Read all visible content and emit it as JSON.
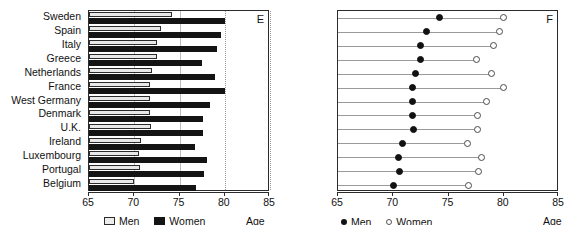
{
  "chart_data": [
    {
      "type": "bar",
      "panel": "E",
      "orientation": "horizontal",
      "title": "",
      "xlabel": "Age",
      "ylabel": "",
      "xlim": [
        65,
        85
      ],
      "xticks": [
        65,
        70,
        75,
        80,
        85
      ],
      "grid": true,
      "legend_position": "bottom",
      "categories": [
        "Sweden",
        "Spain",
        "Italy",
        "Greece",
        "Netherlands",
        "France",
        "West Germany",
        "Denmark",
        "U.K.",
        "Ireland",
        "Luxembourg",
        "Portugal",
        "Belgium"
      ],
      "series": [
        {
          "name": "Men",
          "values": [
            74.2,
            73.0,
            72.5,
            72.5,
            72.0,
            71.7,
            71.7,
            71.7,
            71.8,
            70.8,
            70.5,
            70.6,
            70.0
          ]
        },
        {
          "name": "Women",
          "values": [
            80.0,
            79.6,
            79.1,
            77.5,
            78.9,
            80.0,
            78.4,
            77.6,
            77.6,
            76.7,
            78.0,
            77.7,
            76.8
          ]
        }
      ]
    },
    {
      "type": "scatter",
      "panel": "F",
      "subtype": "dumbbell",
      "title": "",
      "xlabel": "Age",
      "ylabel": "",
      "xlim": [
        65,
        85
      ],
      "xticks": [
        65,
        70,
        75,
        80,
        85
      ],
      "grid": false,
      "legend_position": "bottom",
      "categories": [
        "Sweden",
        "Spain",
        "Italy",
        "Greece",
        "Netherlands",
        "France",
        "West Germany",
        "Denmark",
        "U.K.",
        "Ireland",
        "Luxembourg",
        "Portugal",
        "Belgium"
      ],
      "series": [
        {
          "name": "Men",
          "marker": "filled-circle",
          "values": [
            74.2,
            73.0,
            72.5,
            72.5,
            72.0,
            71.7,
            71.7,
            71.7,
            71.8,
            70.8,
            70.5,
            70.6,
            70.0
          ]
        },
        {
          "name": "Women",
          "marker": "open-circle",
          "values": [
            80.0,
            79.6,
            79.1,
            77.5,
            78.9,
            80.0,
            78.4,
            77.6,
            77.6,
            76.7,
            78.0,
            77.7,
            76.8
          ]
        }
      ]
    }
  ],
  "panel_e": {
    "letter": "E",
    "age_label": "Age",
    "tick_labels": [
      "65",
      "70",
      "75",
      "80",
      "85"
    ],
    "legend": [
      {
        "label": "Men",
        "marker": "light-square-swatch",
        "color": "#ececec"
      },
      {
        "label": "Women",
        "marker": "dark-square-swatch",
        "color": "#141414"
      }
    ],
    "category_labels": [
      "Sweden",
      "Spain",
      "Italy",
      "Greece",
      "Netherlands",
      "France",
      "West Germany",
      "Denmark",
      "U.K.",
      "Ireland",
      "Luxembourg",
      "Portugal",
      "Belgium"
    ]
  },
  "panel_f": {
    "letter": "F",
    "age_label": "Age",
    "tick_labels": [
      "65",
      "70",
      "75",
      "80",
      "85"
    ],
    "legend": [
      {
        "label": "Men",
        "marker": "filled-circle",
        "color": "#111111"
      },
      {
        "label": "Women",
        "marker": "open-circle",
        "color": "#ffffff"
      }
    ]
  },
  "colors": {
    "men_bar": "#ececec",
    "women_bar": "#141414",
    "axis": "#2b2b2b",
    "grid": "#bdbdbd",
    "connector": "#9a9a9a"
  }
}
